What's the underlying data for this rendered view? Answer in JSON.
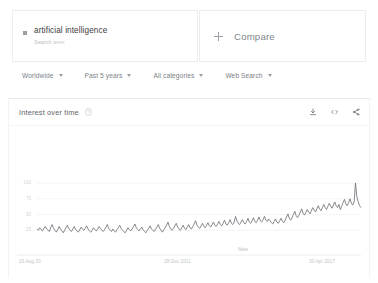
{
  "term_card": {
    "title": "artificial intelligence",
    "subtitle": "Search term",
    "marker_color": "#9aa0a6"
  },
  "compare_card": {
    "label": "Compare",
    "icon": "plus-icon"
  },
  "filters": [
    {
      "label": "Worldwide",
      "icon": "chevron-down-icon"
    },
    {
      "label": "Past 5 years",
      "icon": "chevron-down-icon"
    },
    {
      "label": "All categories",
      "icon": "chevron-down-icon"
    },
    {
      "label": "Web Search",
      "icon": "chevron-down-icon"
    }
  ],
  "chart_panel": {
    "title": "Interest over time",
    "help_icon": "help-circle-icon",
    "help_glyph": "?",
    "actions": [
      {
        "name": "download-icon",
        "title": "Download"
      },
      {
        "name": "embed-icon",
        "title": "Embed",
        "glyph": "<>"
      },
      {
        "name": "share-icon",
        "title": "Share"
      }
    ]
  },
  "chart_data": {
    "type": "line",
    "title": "Interest over time",
    "xlabel": "",
    "ylabel": "",
    "ylim": [
      0,
      108
    ],
    "grid": true,
    "legend": false,
    "line_color": "#6f7478",
    "gridline_color": "#f0f1f2",
    "yticks": [
      100,
      75,
      50,
      25
    ],
    "ytick_labels": [
      "100",
      "75",
      "50",
      "25"
    ],
    "xtick_labels": [
      "26 Aug 20",
      "28 Dec 2011",
      "30 Apr 2017"
    ],
    "annotations": [
      {
        "text": "Note",
        "x_frac": 0.62
      }
    ],
    "series": [
      {
        "name": "artificial intelligence",
        "values": [
          27,
          25,
          29,
          26,
          24,
          28,
          31,
          27,
          25,
          23,
          30,
          34,
          28,
          25,
          22,
          26,
          31,
          27,
          24,
          21,
          25,
          29,
          33,
          28,
          25,
          23,
          27,
          31,
          26,
          24,
          22,
          26,
          30,
          27,
          25,
          28,
          32,
          27,
          24,
          22,
          25,
          29,
          26,
          24,
          27,
          31,
          28,
          25,
          23,
          26,
          30,
          34,
          28,
          25,
          23,
          27,
          24,
          22,
          26,
          29,
          33,
          28,
          25,
          23,
          21,
          25,
          29,
          26,
          24,
          27,
          31,
          35,
          29,
          26,
          24,
          27,
          30,
          26,
          23,
          21,
          25,
          28,
          32,
          27,
          25,
          23,
          27,
          30,
          34,
          28,
          25,
          22,
          26,
          29,
          33,
          38,
          31,
          27,
          25,
          28,
          32,
          36,
          30,
          27,
          25,
          29,
          33,
          28,
          26,
          30,
          34,
          29,
          27,
          31,
          35,
          40,
          33,
          30,
          28,
          32,
          36,
          31,
          29,
          33,
          37,
          32,
          30,
          34,
          38,
          33,
          31,
          35,
          39,
          34,
          32,
          36,
          41,
          35,
          33,
          37,
          42,
          36,
          34,
          38,
          47,
          40,
          36,
          34,
          38,
          42,
          37,
          35,
          39,
          44,
          38,
          36,
          40,
          45,
          39,
          37,
          41,
          46,
          40,
          38,
          42,
          47,
          41,
          39,
          43,
          40,
          37,
          35,
          39,
          43,
          38,
          36,
          40,
          44,
          39,
          37,
          41,
          46,
          51,
          44,
          41,
          45,
          50,
          55,
          48,
          45,
          49,
          54,
          59,
          52,
          49,
          53,
          58,
          54,
          51,
          56,
          61,
          57,
          54,
          59,
          64,
          59,
          56,
          61,
          66,
          61,
          58,
          63,
          68,
          63,
          60,
          65,
          70,
          64,
          61,
          66,
          58,
          63,
          69,
          74,
          67,
          64,
          69,
          75,
          68,
          65,
          70,
          100,
          78,
          70,
          64,
          61
        ]
      }
    ]
  }
}
